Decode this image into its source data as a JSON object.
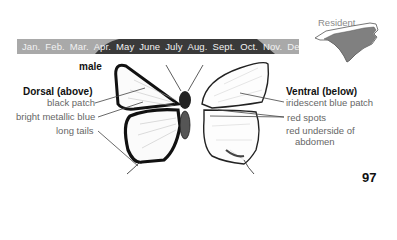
{
  "status": {
    "label": "Resident",
    "map_color": "#808080",
    "map_outline_color": "#555555"
  },
  "flight_period": {
    "months": [
      "Jan.",
      "Feb.",
      "Mar.",
      "Apr.",
      "May",
      "June",
      "July",
      "Aug.",
      "Sept.",
      "Oct.",
      "Nov.",
      "Dec."
    ],
    "bar_color": "#a9a9a9",
    "active_color": "#3a3a3a",
    "active_start": "Mar.",
    "active_end": "Oct."
  },
  "illustration": {
    "sex_label": "male",
    "dorsal": {
      "heading": "Dorsal (above)",
      "annotations": [
        "black patch",
        "bright metallic blue",
        "long tails"
      ]
    },
    "ventral": {
      "heading": "Ventral (below)",
      "annotations": [
        "iridescent blue patch",
        "red spots",
        "red underside of",
        "abdomen"
      ]
    }
  },
  "page_number": "97"
}
